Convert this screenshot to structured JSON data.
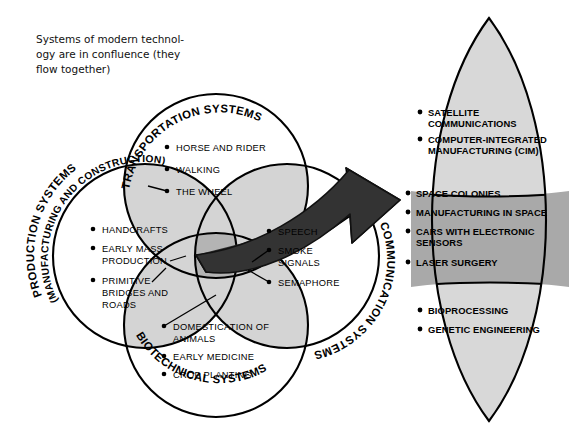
{
  "caption": {
    "lines": [
      "Systems of modern technol-",
      "ogy are in confluence (they",
      "flow together)"
    ]
  },
  "colors": {
    "background": "#ffffff",
    "outline": "#000000",
    "overlap_light": "#d4d4d4",
    "center_overlap": "#b4b4b4",
    "arrow_dark": "#333333",
    "lens_light": "#d8d8d8",
    "lens_mid": "#a9a9a9"
  },
  "venn": {
    "circles": [
      {
        "id": "transportation",
        "label": "TRANSPORTATION SYSTEMS",
        "label2": "",
        "items": [
          "HORSE AND RIDER",
          "WALKING",
          "THE WHEEL"
        ]
      },
      {
        "id": "production",
        "label": "PRODUCTION SYSTEMS",
        "label2": "(MANUFACTURING AND CONSTRUCTION)",
        "items": [
          "HANDCRAFTS",
          "EARLY MASS PRODUCTION",
          "PRIMITIVE BRIDGES AND ROADS"
        ]
      },
      {
        "id": "communication",
        "label": "COMMUNICATION SYSTEMS",
        "label2": "",
        "items": [
          "SPEECH",
          "SMOKE SIGNALS",
          "SEMAPHORE"
        ]
      },
      {
        "id": "biotechnical",
        "label": "BIOTECHNICAL SYSTEMS",
        "label2": "",
        "items": [
          "DOMESTICATION OF ANIMALS",
          "EARLY MEDICINE",
          "CROP PLANTING"
        ]
      }
    ],
    "item_lines": {
      "transportation": [
        [
          "HORSE AND RIDER"
        ],
        [
          "WALKING"
        ],
        [
          "THE WHEEL"
        ]
      ],
      "production": [
        [
          "HANDCRAFTS"
        ],
        [
          "EARLY MASS",
          "PRODUCTION"
        ],
        [
          "PRIMITIVE",
          "BRIDGES AND",
          "ROADS"
        ]
      ],
      "communication": [
        [
          "SPEECH"
        ],
        [
          "SMOKE",
          "SIGNALS"
        ],
        [
          "SEMAPHORE"
        ]
      ],
      "biotechnical": [
        [
          "DOMESTICATION OF",
          "ANIMALS"
        ],
        [
          "EARLY MEDICINE"
        ],
        [
          "CROP PLANTING"
        ]
      ]
    }
  },
  "arrow": {
    "name": "confluence-arrow",
    "direction": "right"
  },
  "lens": {
    "sections": [
      {
        "id": "top",
        "shade": "light",
        "item_lines": [
          [
            "SATELLITE",
            "COMMUNICATIONS"
          ],
          [
            "COMPUTER-INTEGRATED",
            "MANUFACTURING (CIM)"
          ]
        ]
      },
      {
        "id": "middle",
        "shade": "mid",
        "item_lines": [
          [
            "SPACE COLONIES"
          ],
          [
            "MANUFACTURING IN SPACE"
          ],
          [
            "CARS WITH ELECTRONIC",
            "SENSORS"
          ],
          [
            "LASER SURGERY"
          ]
        ]
      },
      {
        "id": "bottom",
        "shade": "light",
        "item_lines": [
          [
            "BIOPROCESSING"
          ],
          [
            "GENETIC ENGINEERING"
          ]
        ]
      }
    ]
  }
}
